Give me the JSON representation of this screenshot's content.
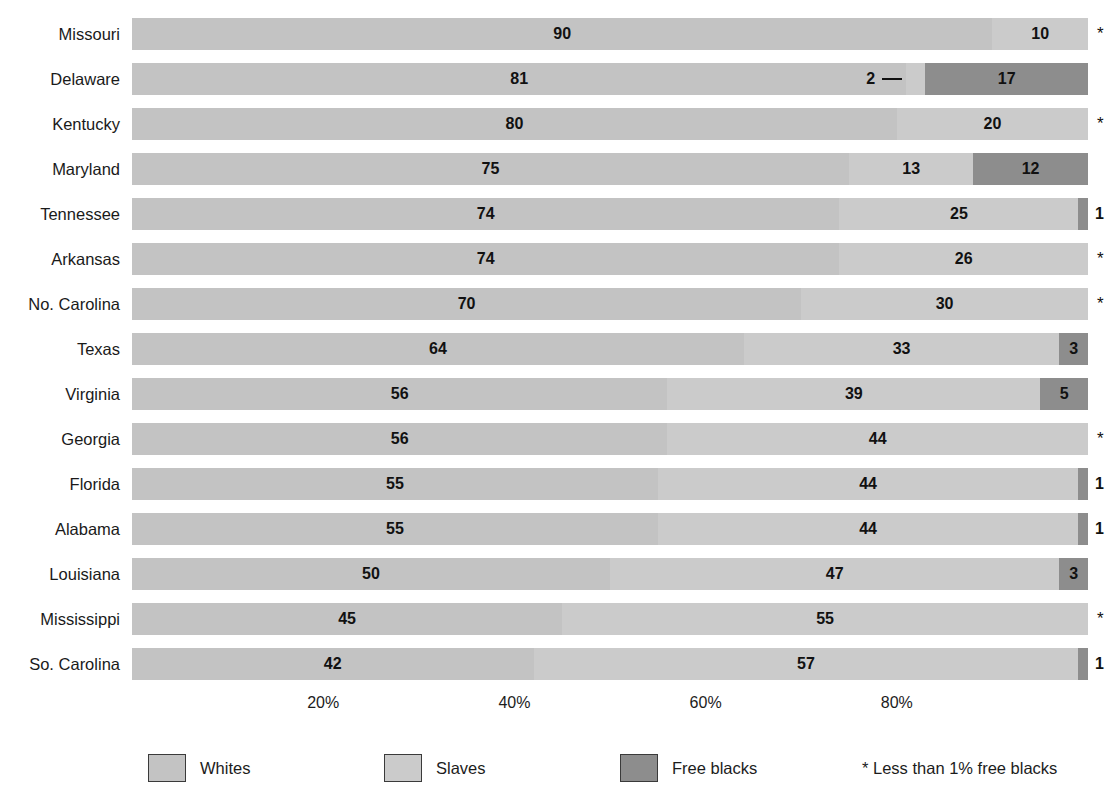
{
  "chart_data": {
    "type": "bar",
    "subtype": "horizontal-stacked-100",
    "title": "",
    "subtitle": "",
    "xlabel": "",
    "ylabel": "",
    "xlim": [
      0,
      100
    ],
    "grid": false,
    "legend_position": "bottom",
    "xticks": [
      "20%",
      "40%",
      "60%",
      "80%"
    ],
    "xtick_values": [
      20,
      40,
      60,
      80
    ],
    "categories": [
      "Missouri",
      "Delaware",
      "Kentucky",
      "Maryland",
      "Tennessee",
      "Arkansas",
      "No. Carolina",
      "Texas",
      "Virginia",
      "Georgia",
      "Florida",
      "Alabama",
      "Louisiana",
      "Mississippi",
      "So. Carolina"
    ],
    "series": [
      {
        "name": "Whites",
        "color": "#c3c3c3",
        "values": [
          90,
          81,
          80,
          75,
          74,
          74,
          70,
          64,
          56,
          56,
          55,
          55,
          50,
          45,
          42
        ]
      },
      {
        "name": "Slaves",
        "color": "#cbcbcb",
        "values": [
          10,
          2,
          20,
          13,
          25,
          26,
          30,
          33,
          39,
          44,
          44,
          44,
          47,
          55,
          57
        ]
      },
      {
        "name": "Free blacks",
        "color": "#8d8d8d",
        "values": [
          0,
          17,
          0,
          12,
          1,
          0,
          0,
          3,
          5,
          0,
          1,
          1,
          3,
          0,
          1
        ]
      }
    ],
    "rows": [
      {
        "state": "Missouri",
        "whites": 90,
        "slaves": 10,
        "free_blacks": 0,
        "free_blacks_label": "*",
        "note": "less-than-1-percent"
      },
      {
        "state": "Delaware",
        "whites": 81,
        "slaves": 2,
        "free_blacks": 17,
        "free_blacks_label": "17",
        "slaves_leader": true
      },
      {
        "state": "Kentucky",
        "whites": 80,
        "slaves": 20,
        "free_blacks": 0,
        "free_blacks_label": "*",
        "note": "less-than-1-percent"
      },
      {
        "state": "Maryland",
        "whites": 75,
        "slaves": 13,
        "free_blacks": 12,
        "free_blacks_label": "12"
      },
      {
        "state": "Tennessee",
        "whites": 74,
        "slaves": 25,
        "free_blacks": 1,
        "free_blacks_label": "1"
      },
      {
        "state": "Arkansas",
        "whites": 74,
        "slaves": 26,
        "free_blacks": 0,
        "free_blacks_label": "*",
        "note": "less-than-1-percent"
      },
      {
        "state": "No. Carolina",
        "whites": 70,
        "slaves": 30,
        "free_blacks": 0,
        "free_blacks_label": "*",
        "note": "less-than-1-percent"
      },
      {
        "state": "Texas",
        "whites": 64,
        "slaves": 33,
        "free_blacks": 3,
        "free_blacks_label": "3"
      },
      {
        "state": "Virginia",
        "whites": 56,
        "slaves": 39,
        "free_blacks": 5,
        "free_blacks_label": "5"
      },
      {
        "state": "Georgia",
        "whites": 56,
        "slaves": 44,
        "free_blacks": 0,
        "free_blacks_label": "*",
        "note": "less-than-1-percent"
      },
      {
        "state": "Florida",
        "whites": 55,
        "slaves": 44,
        "free_blacks": 1,
        "free_blacks_label": "1"
      },
      {
        "state": "Alabama",
        "whites": 55,
        "slaves": 44,
        "free_blacks": 1,
        "free_blacks_label": "1"
      },
      {
        "state": "Louisiana",
        "whites": 50,
        "slaves": 47,
        "free_blacks": 3,
        "free_blacks_label": "3"
      },
      {
        "state": "Mississippi",
        "whites": 45,
        "slaves": 55,
        "free_blacks": 0,
        "free_blacks_label": "*",
        "note": "less-than-1-percent"
      },
      {
        "state": "So. Carolina",
        "whites": 42,
        "slaves": 57,
        "free_blacks": 1,
        "free_blacks_label": "1"
      }
    ],
    "annotations": [
      {
        "text": "2",
        "applies_to": "Delaware",
        "series": "Slaves",
        "style": "leader-line-outside"
      }
    ]
  },
  "legend": {
    "items": [
      {
        "label": "Whites",
        "color": "#c3c3c3"
      },
      {
        "label": "Slaves",
        "color": "#cbcbcb"
      },
      {
        "label": "Free blacks",
        "color": "#8d8d8d"
      }
    ],
    "note": "* Less than 1% free blacks",
    "star_glyph": "*"
  },
  "colors": {
    "whites": "#c3c3c3",
    "slaves": "#cbcbcb",
    "free_blacks": "#8d8d8d",
    "text": "#1c1c1c",
    "background": "#ffffff"
  }
}
